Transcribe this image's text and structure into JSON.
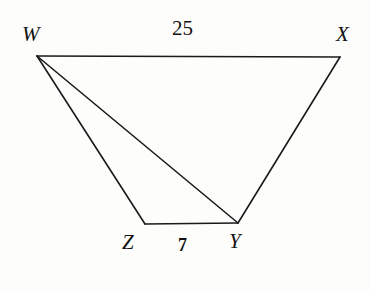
{
  "figure": {
    "kind": "quadrilateral-with-diagonal",
    "name": "WXYZ",
    "background_color": "#fdfdfc",
    "stroke_color": "#1a1a1a",
    "stroke_width": 1.6,
    "canvas": {
      "width": 370,
      "height": 291
    }
  },
  "vertices": {
    "W": {
      "label": "W",
      "x": 37,
      "y": 56
    },
    "X": {
      "label": "X",
      "x": 340,
      "y": 57
    },
    "Y": {
      "label": "Y",
      "x": 238,
      "y": 223
    },
    "Z": {
      "label": "Z",
      "x": 145,
      "y": 224
    }
  },
  "edges": [
    {
      "name": "WX",
      "from": "W",
      "to": "X",
      "kind": "side"
    },
    {
      "name": "XY",
      "from": "X",
      "to": "Y",
      "kind": "side"
    },
    {
      "name": "YZ",
      "from": "Y",
      "to": "Z",
      "kind": "side"
    },
    {
      "name": "ZW",
      "from": "Z",
      "to": "W",
      "kind": "side"
    },
    {
      "name": "WY",
      "from": "W",
      "to": "Y",
      "kind": "diagonal"
    }
  ],
  "measurements": {
    "WX": {
      "value": "25",
      "edge": "WX"
    },
    "ZY": {
      "value": "7",
      "edge": "YZ"
    }
  }
}
